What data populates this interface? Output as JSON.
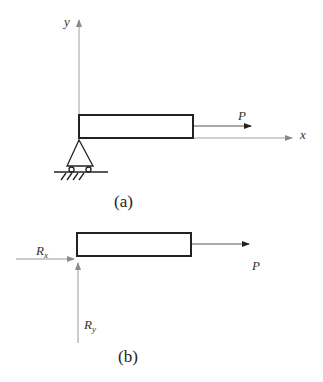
{
  "figure_a": {
    "caption": "(a)",
    "axis_y_label": "y",
    "axis_x_label": "x",
    "force_label": "P",
    "support": "pin-roller-support-icon"
  },
  "figure_b": {
    "caption": "(b)",
    "reaction_x_main": "R",
    "reaction_x_sub": "x",
    "reaction_y_main": "R",
    "reaction_y_sub": "y",
    "force_label": "P"
  },
  "colors": {
    "beam_stroke": "#222222",
    "axis_stroke": "#999999",
    "arrow_dark": "#222222",
    "arrow_gray": "#8a8a8a"
  }
}
